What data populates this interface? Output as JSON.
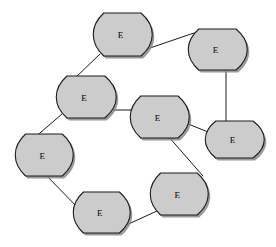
{
  "diagram": {
    "type": "node-link",
    "background_color": "#ffffff",
    "node_fill_color": "#cccccc",
    "node_stroke_color": "#1a1a1a",
    "node_shadow_color": "#8a8a8a",
    "edge_color": "#1a1a1a",
    "node_shape": "flag-banner",
    "node_count": 8,
    "edge_count": 8,
    "nodes": [
      {
        "id": "n1",
        "label": "E",
        "x": 93,
        "y": 13,
        "w": 60,
        "h": 43,
        "name": "entity-node-top"
      },
      {
        "id": "n2",
        "label": "E",
        "x": 188,
        "y": 29,
        "w": 60,
        "h": 41,
        "name": "entity-node-top-right"
      },
      {
        "id": "n3",
        "label": "E",
        "x": 56,
        "y": 76,
        "w": 61,
        "h": 42,
        "name": "entity-node-upper-left"
      },
      {
        "id": "n4",
        "label": "E",
        "x": 130,
        "y": 96,
        "w": 60,
        "h": 42,
        "name": "entity-node-center"
      },
      {
        "id": "n5",
        "label": "E",
        "x": 205,
        "y": 121,
        "w": 60,
        "h": 37,
        "name": "entity-node-middle-right"
      },
      {
        "id": "n6",
        "label": "E",
        "x": 15,
        "y": 134,
        "w": 59,
        "h": 42,
        "name": "entity-node-left"
      },
      {
        "id": "n7",
        "label": "E",
        "x": 150,
        "y": 173,
        "w": 59,
        "h": 42,
        "name": "entity-node-lower-right"
      },
      {
        "id": "n8",
        "label": "E",
        "x": 73,
        "y": 192,
        "w": 58,
        "h": 41,
        "name": "entity-node-bottom"
      }
    ],
    "edges": [
      {
        "id": "e1",
        "from": "n3",
        "to": "n1",
        "x1": 73,
        "y1": 80,
        "x2": 100,
        "y2": 54,
        "name": "edge-upper-left-to-top"
      },
      {
        "id": "e2",
        "from": "n1",
        "to": "n2",
        "x1": 147,
        "y1": 49,
        "x2": 194,
        "y2": 33,
        "name": "edge-top-to-top-right"
      },
      {
        "id": "e3",
        "from": "n2",
        "to": "n5",
        "x1": 226,
        "y1": 70,
        "x2": 226,
        "y2": 124,
        "name": "edge-top-right-to-middle-right"
      },
      {
        "id": "e4",
        "from": "n3",
        "to": "n4",
        "x1": 112,
        "y1": 110,
        "x2": 135,
        "y2": 110,
        "name": "edge-upper-left-to-center"
      },
      {
        "id": "e5",
        "from": "n3",
        "to": "n6",
        "x1": 62,
        "y1": 114,
        "x2": 33,
        "y2": 139,
        "name": "edge-upper-left-to-left"
      },
      {
        "id": "e6",
        "from": "n4",
        "to": "n5",
        "x1": 176,
        "y1": 119,
        "x2": 208,
        "y2": 132,
        "name": "edge-center-to-middle-right"
      },
      {
        "id": "e7",
        "from": "n4",
        "to": "n7",
        "x1": 168,
        "y1": 136,
        "x2": 203,
        "y2": 176,
        "name": "edge-center-to-lower-right"
      },
      {
        "id": "e8",
        "from": "n6",
        "to": "n8",
        "x1": 44,
        "y1": 173,
        "x2": 82,
        "y2": 212,
        "name": "edge-left-to-bottom"
      },
      {
        "id": "e9",
        "from": "n8",
        "to": "n7",
        "x1": 122,
        "y1": 227,
        "x2": 157,
        "y2": 211,
        "name": "edge-bottom-to-lower-right"
      }
    ]
  }
}
